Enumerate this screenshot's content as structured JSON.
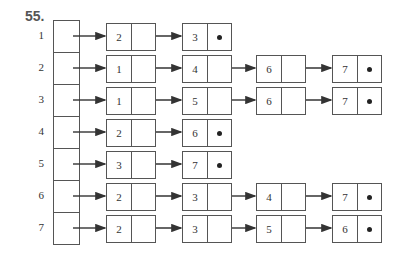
{
  "problem_number": "55.",
  "rows": [
    {
      "index": "1",
      "list": [
        "2",
        "3"
      ]
    },
    {
      "index": "2",
      "list": [
        "1",
        "4",
        "6",
        "7"
      ]
    },
    {
      "index": "3",
      "list": [
        "1",
        "5",
        "6",
        "7"
      ]
    },
    {
      "index": "4",
      "list": [
        "2",
        "6"
      ]
    },
    {
      "index": "5",
      "list": [
        "3",
        "7"
      ]
    },
    {
      "index": "6",
      "list": [
        "2",
        "3",
        "4",
        "7"
      ]
    },
    {
      "index": "7",
      "list": [
        "2",
        "3",
        "5",
        "6"
      ]
    }
  ],
  "null_pointer_symbol": "dot"
}
